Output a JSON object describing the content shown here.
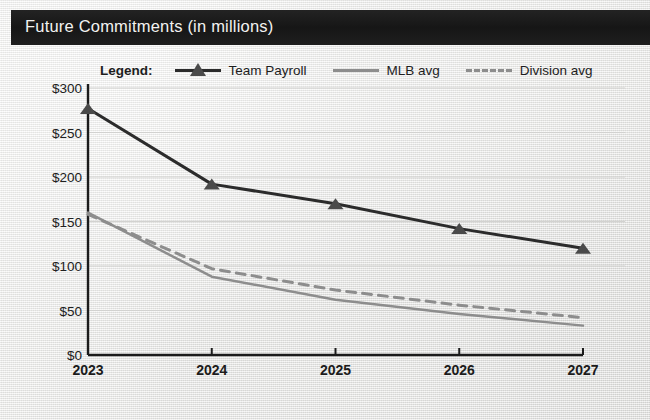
{
  "header": {
    "title": "Future Commitments (in millions)",
    "bar_color": "#1c1c1c",
    "text_color": "#f2f2f0"
  },
  "legend": {
    "title": "Legend:",
    "entries": [
      {
        "label": "Team Payroll",
        "style": "solid-marker",
        "color": "#2b2b2b",
        "marker": "triangle"
      },
      {
        "label": "MLB avg",
        "style": "solid",
        "color": "#8d8d8d",
        "marker": "none"
      },
      {
        "label": "Division avg",
        "style": "dashed",
        "color": "#8d8d8d",
        "marker": "none"
      }
    ]
  },
  "chart_data": {
    "type": "line",
    "title": "Future Commitments (in millions)",
    "xlabel": "",
    "ylabel": "",
    "categories": [
      "2023",
      "2024",
      "2025",
      "2026",
      "2027"
    ],
    "x": [
      2023,
      2024,
      2025,
      2026,
      2027
    ],
    "ylim": [
      0,
      300
    ],
    "ytick_values": [
      0,
      50,
      100,
      150,
      200,
      250,
      300
    ],
    "ytick_labels": [
      "$0",
      "$50",
      "$100",
      "$150",
      "$200",
      "$250",
      "$300"
    ],
    "xtick_labels": [
      "2023",
      "2024",
      "2025",
      "2026",
      "2027"
    ],
    "grid": true,
    "grid_axis": "y",
    "legend_position": "top",
    "series": [
      {
        "name": "Team Payroll",
        "values": [
          277,
          192,
          170,
          142,
          120
        ],
        "color": "#2b2b2b",
        "style": "solid",
        "marker": "triangle",
        "width": 3
      },
      {
        "name": "MLB avg",
        "values": [
          160,
          88,
          62,
          46,
          33
        ],
        "color": "#8d8d8d",
        "style": "solid",
        "marker": "none",
        "width": 2.5
      },
      {
        "name": "Division avg",
        "values": [
          158,
          97,
          73,
          56,
          42
        ],
        "color": "#8d8d8d",
        "style": "dashed",
        "marker": "none",
        "width": 3
      }
    ]
  },
  "axis": {
    "line_color": "#1b1b1b",
    "grid_color": "#d2d2d0"
  }
}
